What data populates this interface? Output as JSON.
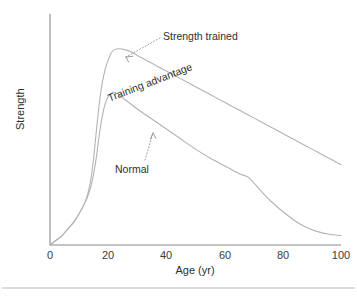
{
  "chart_data": {
    "type": "line",
    "title": "",
    "subtitle": "",
    "xlabel": "Age (yr)",
    "ylabel": "Strength",
    "xlim": [
      0,
      100
    ],
    "ylim": [
      0,
      100
    ],
    "xticks": [
      0,
      20,
      40,
      60,
      80,
      100
    ],
    "xtick_labels": [
      "0",
      "20",
      "40",
      "60",
      "80",
      "100"
    ],
    "yticks": [],
    "ytick_labels": [],
    "grid": false,
    "legend_position": "none",
    "axis_style": "open-left-bottom",
    "line_color": "#b3b3b3",
    "axis_color": "#8a8a8a",
    "text_color": "#2e2e2e",
    "background": "#ffffff",
    "series": [
      {
        "name": "Strength trained",
        "color": "#b3b3b3",
        "x": [
          0,
          2,
          4,
          6,
          8,
          10,
          12,
          13,
          14,
          15,
          16,
          17,
          18,
          19,
          20,
          21,
          22,
          24,
          26,
          28,
          30,
          35,
          40,
          45,
          50,
          55,
          60,
          65,
          70,
          75,
          80,
          85,
          90,
          95,
          100
        ],
        "y": [
          0,
          2,
          4,
          7,
          10,
          14,
          19,
          23,
          29,
          39,
          52,
          64,
          73,
          79,
          83,
          86,
          87.5,
          88,
          87.5,
          86.5,
          85,
          81.5,
          78,
          74.5,
          71,
          67.5,
          64,
          60.5,
          57,
          53.5,
          50,
          46.5,
          43,
          39.5,
          36
        ]
      },
      {
        "name": "Normal",
        "color": "#b3b3b3",
        "x": [
          0,
          2,
          4,
          6,
          8,
          10,
          12,
          13,
          14,
          15,
          16,
          17,
          18,
          19,
          20,
          21,
          22,
          23,
          25,
          27,
          30,
          35,
          40,
          45,
          50,
          55,
          60,
          65,
          68,
          70,
          73,
          76,
          80,
          84,
          88,
          92,
          96,
          100
        ],
        "y": [
          0,
          2,
          4,
          7,
          10,
          14,
          19,
          22,
          26,
          32,
          40,
          50,
          58,
          63.5,
          66.5,
          68,
          68.5,
          68,
          66,
          64,
          61,
          56.5,
          52,
          47.5,
          43,
          39,
          35.5,
          32,
          30.5,
          28,
          23.5,
          19.5,
          15,
          11,
          8,
          6,
          4.8,
          4.2
        ]
      }
    ],
    "annotations": [
      {
        "id": "strength-trained",
        "text": "Strength trained",
        "kind": "label-with-leader",
        "points_to_series": "Strength trained",
        "points_to_x": 28,
        "rotation": 0
      },
      {
        "id": "training-advantage",
        "text": "Training advantage",
        "kind": "inline-band-label",
        "rotation": -21
      },
      {
        "id": "normal",
        "text": "Normal",
        "kind": "label-with-leader",
        "points_to_series": "Normal",
        "points_to_x": 47,
        "rotation": 0
      }
    ]
  },
  "axes": {
    "x_title": "Age (yr)",
    "y_title": "Strength",
    "x_tick_labels": [
      "0",
      "20",
      "40",
      "60",
      "80",
      "100"
    ]
  },
  "annotations": {
    "strength_trained": "Strength trained",
    "training_advantage": "Training advantage",
    "normal": "Normal"
  }
}
